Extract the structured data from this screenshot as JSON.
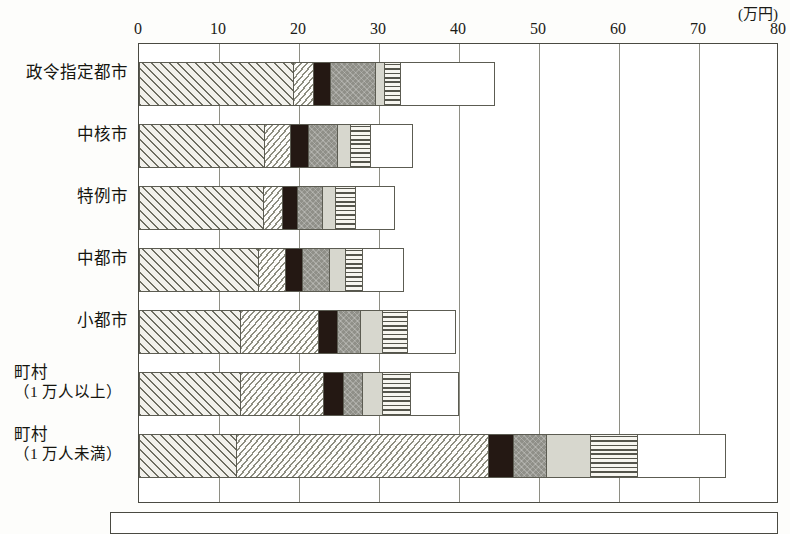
{
  "chart_data": {
    "type": "bar",
    "orientation": "horizontal",
    "stacked": true,
    "title": "",
    "xlabel": "",
    "ylabel": "",
    "unit_label": "(万円)",
    "xlim": [
      0,
      80
    ],
    "xticks": [
      0,
      10,
      20,
      30,
      40,
      50,
      60,
      70,
      80
    ],
    "xtick_labels": [
      "0",
      "10",
      "20",
      "30",
      "40",
      "50",
      "60",
      "70",
      "80"
    ],
    "grid": true,
    "legend_position": "bottom",
    "categories": [
      "政令指定都市",
      "中核市",
      "特例市",
      "中都市",
      "小都市",
      "町村（1万人以上）",
      "町村（1万人未満）"
    ],
    "category_lines": [
      [
        "政令指定都市"
      ],
      [
        "中核市"
      ],
      [
        "特例市"
      ],
      [
        "中都市"
      ],
      [
        "小都市"
      ],
      [
        "町村",
        "（1 万人以上）"
      ],
      [
        "町村",
        "（1 万人未満）"
      ]
    ],
    "series": [
      {
        "name": "series-1",
        "pattern": "diagonal-hatch",
        "values": [
          19.4,
          15.8,
          15.6,
          15.0,
          12.8,
          12.8,
          12.2
        ]
      },
      {
        "name": "series-2",
        "pattern": "dotted-weave",
        "values": [
          2.5,
          3.2,
          2.4,
          3.4,
          9.7,
          10.3,
          31.5
        ]
      },
      {
        "name": "series-3",
        "pattern": "solid-black",
        "values": [
          2.1,
          2.3,
          1.9,
          2.1,
          2.4,
          2.5,
          3.2
        ]
      },
      {
        "name": "series-4",
        "pattern": "dark-gray",
        "values": [
          5.6,
          3.6,
          3.1,
          3.4,
          2.9,
          2.4,
          4.1
        ]
      },
      {
        "name": "series-5",
        "pattern": "light-gray",
        "values": [
          1.2,
          1.6,
          1.6,
          2.0,
          2.7,
          2.5,
          5.5
        ]
      },
      {
        "name": "series-6",
        "pattern": "horizontal-line",
        "values": [
          2.0,
          2.5,
          2.5,
          2.1,
          3.1,
          3.5,
          5.9
        ]
      },
      {
        "name": "series-7",
        "pattern": "white",
        "values": [
          11.7,
          5.3,
          4.9,
          5.1,
          6.0,
          6.0,
          11.0
        ]
      }
    ],
    "totals": [
      44.0,
      34.3,
      32.0,
      33.1,
      39.6,
      40.0,
      73.4
    ]
  },
  "legend": {
    "caption": ""
  }
}
